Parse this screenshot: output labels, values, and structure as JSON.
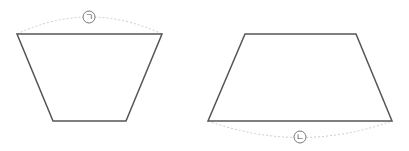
{
  "figures": [
    {
      "name": "left-trapezoid",
      "points": "17,34 162,34 126,121 53,121",
      "arc": {
        "path": "M17,34 Q89,0 162,34",
        "side": "top"
      },
      "label": {
        "text": "ㄱ",
        "cx": 89,
        "cy": 17
      }
    },
    {
      "name": "right-trapezoid",
      "points": "245,34 356,34 392,121 208,121",
      "arc": {
        "path": "M208,121 Q300,154 392,121",
        "side": "bottom"
      },
      "label": {
        "text": "ㄴ",
        "cx": 300,
        "cy": 137
      }
    }
  ],
  "colors": {
    "stroke": "#555555",
    "arc": "#cccccc",
    "label_circle": "#777777"
  }
}
